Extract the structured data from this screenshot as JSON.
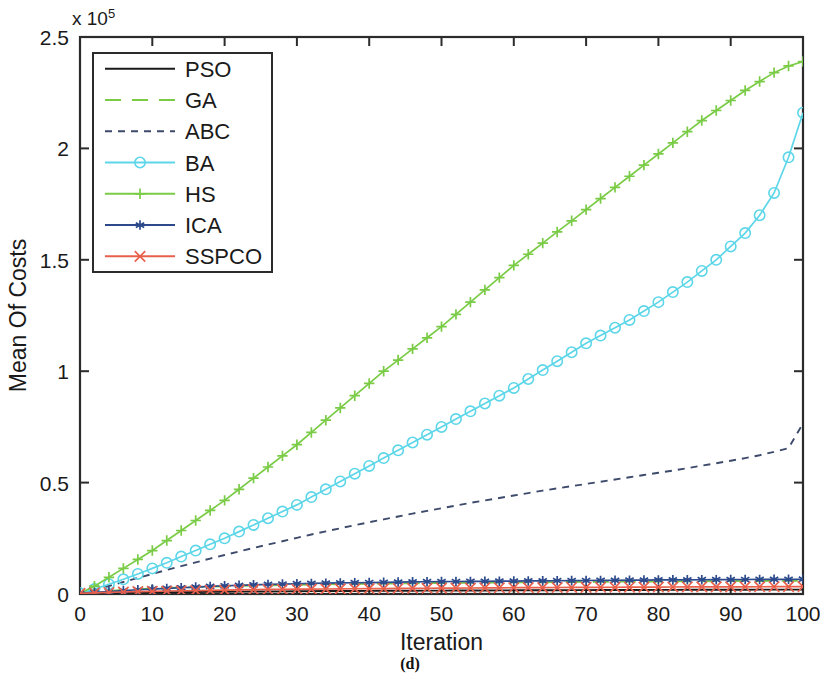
{
  "caption": "(d)",
  "chart_data": {
    "type": "line",
    "title": "",
    "subtitle": "",
    "xlabel": "Iteration",
    "ylabel": "Mean Of Costs",
    "y_exponent_label": "x 10",
    "y_exponent_superscript": "5",
    "y_scale_factor": 100000,
    "xlim": [
      0,
      100
    ],
    "ylim": [
      0,
      250000
    ],
    "xticks": [
      0,
      10,
      20,
      30,
      40,
      50,
      60,
      70,
      80,
      90,
      100
    ],
    "xticklabels": [
      "0",
      "10",
      "20",
      "30",
      "40",
      "50",
      "60",
      "70",
      "80",
      "90",
      "100"
    ],
    "yticks": [
      0,
      50000,
      100000,
      150000,
      200000,
      250000
    ],
    "yticklabels": [
      "0",
      "0.5",
      "1",
      "1.5",
      "2",
      "2.5"
    ],
    "grid": false,
    "legend_position": "upper left",
    "x": [
      0,
      2,
      4,
      6,
      8,
      10,
      12,
      14,
      16,
      18,
      20,
      22,
      24,
      26,
      28,
      30,
      32,
      34,
      36,
      38,
      40,
      42,
      44,
      46,
      48,
      50,
      52,
      54,
      56,
      58,
      60,
      62,
      64,
      66,
      68,
      70,
      72,
      74,
      76,
      78,
      80,
      82,
      84,
      86,
      88,
      90,
      92,
      94,
      96,
      98,
      100
    ],
    "series": [
      {
        "name": "PSO",
        "color": "#1a1a1a",
        "dash": "none",
        "marker": "none",
        "values": [
          300,
          400,
          500,
          600,
          700,
          750,
          800,
          850,
          900,
          950,
          1000,
          1050,
          1100,
          1150,
          1200,
          1250,
          1300,
          1320,
          1350,
          1380,
          1400,
          1430,
          1450,
          1480,
          1500,
          1520,
          1550,
          1570,
          1600,
          1620,
          1650,
          1670,
          1690,
          1710,
          1730,
          1750,
          1770,
          1790,
          1800,
          1820,
          1840,
          1860,
          1880,
          1900,
          1910,
          1920,
          1940,
          1950,
          1960,
          1970,
          1980
        ]
      },
      {
        "name": "GA",
        "color": "#7ACB46",
        "dash": "dashed",
        "marker": "none",
        "values": [
          500,
          900,
          1400,
          1800,
          2100,
          2400,
          2700,
          2900,
          3100,
          3300,
          3500,
          3650,
          3800,
          3950,
          4050,
          4150,
          4250,
          4350,
          4450,
          4500,
          4600,
          4700,
          4750,
          4800,
          4900,
          4950,
          5000,
          5050,
          5100,
          5150,
          5200,
          5250,
          5300,
          5350,
          5400,
          5450,
          5500,
          5530,
          5560,
          5600,
          5630,
          5660,
          5700,
          5730,
          5760,
          5800,
          5830,
          5860,
          5900,
          5930,
          5960
        ]
      },
      {
        "name": "ABC",
        "color": "#3d4a6b",
        "dash": "dotted",
        "marker": "none",
        "values": [
          200,
          1800,
          3600,
          5400,
          7200,
          9000,
          10800,
          12500,
          14200,
          15900,
          17500,
          19100,
          20700,
          22200,
          23700,
          25200,
          26700,
          28100,
          29500,
          30900,
          32200,
          33500,
          34800,
          36100,
          37300,
          38500,
          39700,
          40900,
          42000,
          43100,
          44200,
          45300,
          46400,
          47400,
          48400,
          49400,
          50400,
          51400,
          52400,
          53400,
          54400,
          55400,
          56500,
          57600,
          58700,
          59800,
          61000,
          62300,
          63800,
          65500,
          76500
        ]
      },
      {
        "name": "BA",
        "color": "#5CD6E8",
        "dash": "none",
        "marker": "circle",
        "values": [
          300,
          2200,
          4400,
          6600,
          9000,
          11500,
          14000,
          16800,
          19500,
          22300,
          25000,
          28000,
          31000,
          34000,
          37000,
          40000,
          43500,
          47000,
          50500,
          54000,
          57500,
          61000,
          64500,
          68000,
          71500,
          75000,
          78500,
          82000,
          85500,
          89000,
          92500,
          96500,
          100500,
          104500,
          108500,
          112500,
          116000,
          119500,
          123000,
          127000,
          131000,
          135500,
          140000,
          145000,
          150000,
          156000,
          162000,
          170000,
          180000,
          196000,
          216000
        ]
      },
      {
        "name": "HS",
        "color": "#7ACB46",
        "dash": "none",
        "marker": "plus",
        "values": [
          400,
          3500,
          7500,
          11500,
          15500,
          19500,
          24000,
          28500,
          33000,
          37500,
          42000,
          47000,
          52000,
          57000,
          62000,
          67000,
          72500,
          78000,
          83500,
          89000,
          94500,
          100000,
          105000,
          110000,
          115000,
          120000,
          125500,
          131000,
          136500,
          142000,
          147500,
          152500,
          157500,
          162500,
          167500,
          172500,
          177500,
          182500,
          187500,
          192500,
          197500,
          202500,
          207500,
          212500,
          217000,
          221500,
          226000,
          230000,
          234000,
          237000,
          239000
        ]
      },
      {
        "name": "ICA",
        "color": "#2C4A8C",
        "dash": "none",
        "marker": "star",
        "values": [
          400,
          700,
          1100,
          1500,
          1900,
          2200,
          2500,
          2800,
          3100,
          3400,
          3700,
          3900,
          4100,
          4300,
          4450,
          4600,
          4750,
          4850,
          4950,
          5050,
          5150,
          5250,
          5350,
          5450,
          5500,
          5550,
          5600,
          5650,
          5700,
          5750,
          5800,
          5850,
          5900,
          5950,
          6000,
          6050,
          6100,
          6150,
          6200,
          6250,
          6300,
          6330,
          6360,
          6400,
          6430,
          6460,
          6500,
          6530,
          6560,
          6600,
          6630
        ]
      },
      {
        "name": "SSPCO",
        "color": "#E8604C",
        "dash": "none",
        "marker": "cross",
        "values": [
          300,
          500,
          700,
          900,
          1050,
          1200,
          1350,
          1450,
          1550,
          1650,
          1750,
          1850,
          1950,
          2050,
          2100,
          2150,
          2200,
          2250,
          2300,
          2350,
          2400,
          2450,
          2500,
          2550,
          2580,
          2620,
          2660,
          2700,
          2740,
          2780,
          2820,
          2850,
          2880,
          2910,
          2940,
          2970,
          3000,
          3030,
          3060,
          3090,
          3120,
          3140,
          3160,
          3180,
          3200,
          3220,
          3240,
          3260,
          3280,
          3300,
          3320
        ]
      }
    ]
  }
}
